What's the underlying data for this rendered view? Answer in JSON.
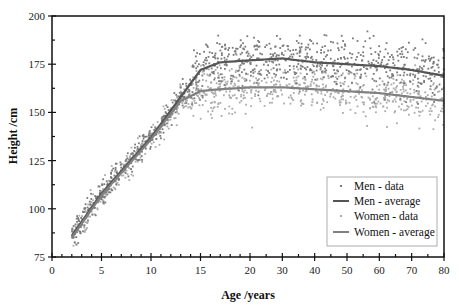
{
  "chart_data": {
    "type": "scatter",
    "title": "",
    "xlabel": "Age /years",
    "ylabel": "Height /cm",
    "xlim": [
      0,
      80
    ],
    "ylim": [
      75,
      200
    ],
    "x_axis_note": "broken scale: 0-20 linear (1-year minor ticks), 20-80 compressed (5-year minor ticks)",
    "x_major_ticks": [
      0,
      5,
      10,
      15,
      20,
      30,
      40,
      50,
      60,
      70,
      80
    ],
    "y_major_ticks": [
      75,
      100,
      125,
      150,
      175,
      200
    ],
    "grid": false,
    "legend_position": "lower right",
    "legend": [
      "Men - data",
      "Men - average",
      "Women - data",
      "Women - average"
    ],
    "series": [
      {
        "name": "Men - average",
        "type": "line",
        "color": "#555555",
        "x": [
          2,
          5,
          10,
          13,
          15,
          17,
          20,
          30,
          40,
          50,
          60,
          70,
          80
        ],
        "y": [
          86,
          108,
          137,
          158,
          172,
          176,
          177,
          178,
          176,
          175,
          174,
          172,
          169
        ]
      },
      {
        "name": "Women - average",
        "type": "line",
        "color": "#808080",
        "x": [
          2,
          5,
          10,
          13,
          15,
          17,
          20,
          30,
          40,
          50,
          60,
          70,
          80
        ],
        "y": [
          85,
          107,
          136,
          156,
          161,
          162,
          163,
          163,
          162,
          161,
          160,
          158,
          156
        ]
      },
      {
        "name": "Men - data",
        "type": "scatter",
        "color": "#7a7a7a",
        "spread_sd_child": 3.5,
        "spread_sd_adult": 6.5,
        "approx_points": 900
      },
      {
        "name": "Women - data",
        "type": "scatter",
        "color": "#ababab",
        "spread_sd_child": 3.5,
        "spread_sd_adult": 6.0,
        "approx_points": 900
      }
    ]
  },
  "axes": {
    "x_title": "Age /years",
    "y_title": "Height /cm",
    "x_tick_labels": [
      "0",
      "5",
      "10",
      "15",
      "20",
      "30",
      "40",
      "50",
      "60",
      "70",
      "80"
    ],
    "y_tick_labels": [
      "75",
      "100",
      "125",
      "150",
      "175",
      "200"
    ]
  },
  "legend": {
    "items": [
      {
        "label": "Men - data",
        "kind": "dot",
        "color": "#7a7a7a"
      },
      {
        "label": "Men - average",
        "kind": "line",
        "color": "#555555"
      },
      {
        "label": "Women - data",
        "kind": "dot",
        "color": "#ababab"
      },
      {
        "label": "Women - average",
        "kind": "line",
        "color": "#808080"
      }
    ]
  }
}
